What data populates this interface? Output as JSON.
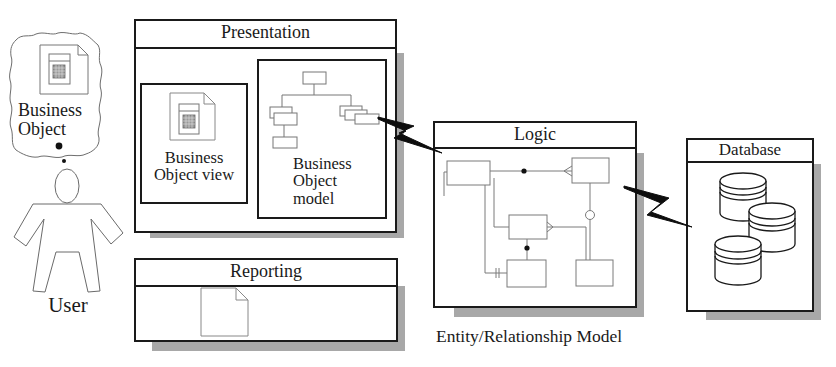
{
  "user": {
    "label": "User",
    "thought": {
      "line1": "Business",
      "line2": "Object"
    }
  },
  "presentation": {
    "title": "Presentation",
    "view": {
      "line1": "Business",
      "line2": "Object view"
    },
    "model": {
      "line1": "Business",
      "line2": "Object",
      "line3": "model"
    }
  },
  "reporting": {
    "title": "Reporting"
  },
  "logic": {
    "title": "Logic",
    "caption": "Entity/Relationship Model"
  },
  "database": {
    "title": "Database"
  },
  "colors": {
    "stroke": "#1a1a1a",
    "shadow": "#a8a8a8",
    "thin": "#7a7a7a"
  }
}
